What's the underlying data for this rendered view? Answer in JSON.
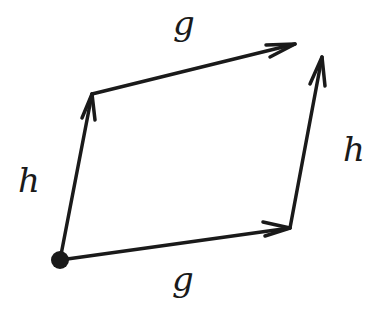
{
  "diagram": {
    "title": "",
    "stroke_color": "#1a1a1a",
    "background": "#ffffff",
    "labels": {
      "top_edge": "g",
      "bottom_edge": "g",
      "left_edge": "h",
      "right_edge": "h"
    },
    "nodes": [
      {
        "id": "origin",
        "x": 60,
        "y": 260,
        "marked": true
      },
      {
        "id": "after_h",
        "x": 92,
        "y": 94
      },
      {
        "id": "after_g",
        "x": 290,
        "y": 228
      },
      {
        "id": "end_gh_top",
        "x": 295,
        "y": 44
      },
      {
        "id": "end_hg_right",
        "x": 322,
        "y": 57
      }
    ],
    "edges": [
      {
        "from": "origin",
        "to": "after_h",
        "label": "h"
      },
      {
        "from": "after_h",
        "to": "end_gh_top",
        "label": "g"
      },
      {
        "from": "origin",
        "to": "after_g",
        "label": "g"
      },
      {
        "from": "after_g",
        "to": "end_hg_right",
        "label": "h"
      }
    ]
  }
}
